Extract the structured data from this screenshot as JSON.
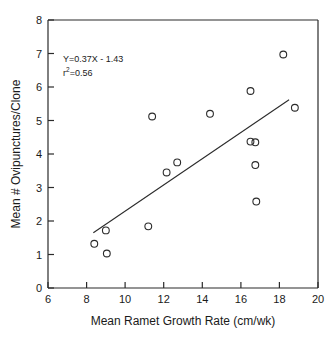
{
  "chart_data": {
    "type": "scatter",
    "title": "",
    "xlabel": "Mean Ramet Growth Rate (cm/wk)",
    "ylabel": "Mean # Ovipunctures/Clone",
    "xlim": [
      6,
      20
    ],
    "ylim": [
      0,
      8
    ],
    "xticks": [
      "6",
      "8",
      "10",
      "12",
      "14",
      "16",
      "18",
      "20"
    ],
    "yticks": [
      "0",
      "1",
      "2",
      "3",
      "4",
      "5",
      "6",
      "7",
      "8"
    ],
    "grid": false,
    "legend": "none",
    "marker": "open-circle",
    "points": [
      {
        "x": 8.4,
        "y": 1.32
      },
      {
        "x": 9.0,
        "y": 1.72
      },
      {
        "x": 9.05,
        "y": 1.03
      },
      {
        "x": 11.2,
        "y": 1.84
      },
      {
        "x": 11.4,
        "y": 5.12
      },
      {
        "x": 12.15,
        "y": 3.45
      },
      {
        "x": 12.7,
        "y": 3.75
      },
      {
        "x": 14.4,
        "y": 5.2
      },
      {
        "x": 16.5,
        "y": 5.88
      },
      {
        "x": 16.5,
        "y": 4.37
      },
      {
        "x": 16.75,
        "y": 4.35
      },
      {
        "x": 16.75,
        "y": 3.67
      },
      {
        "x": 16.8,
        "y": 2.58
      },
      {
        "x": 18.2,
        "y": 6.97
      },
      {
        "x": 18.8,
        "y": 5.38
      }
    ],
    "fit_line": {
      "equation": "Y=0.37X - 1.43",
      "r_squared_label": "r",
      "r_squared_exponent": "2",
      "r_squared_value": "=0.56",
      "slope": 0.37,
      "intercept": -1.43,
      "x_start": 8.35,
      "x_end": 18.5,
      "y_start": 1.65,
      "y_end": 5.62
    },
    "colors": {
      "axis": "#2b2b2b",
      "marker": "#2b2b2b",
      "line": "#2b2b2b",
      "background": "#ffffff"
    }
  }
}
